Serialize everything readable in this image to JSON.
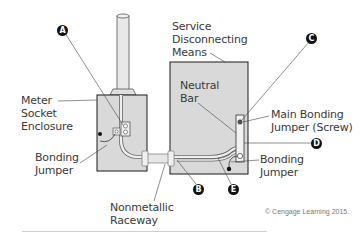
{
  "diagram": {
    "labels": {
      "service_disconnect": [
        "Service",
        "Disconnecting",
        "Means"
      ],
      "neutral_bar": [
        "Neutral",
        "Bar"
      ],
      "meter_socket": [
        "Meter",
        "Socket",
        "Enclosure"
      ],
      "bonding_jumper_left": [
        "Bonding",
        "Jumper"
      ],
      "main_bonding_jumper": [
        "Main Bonding",
        "Jumper (Screw)"
      ],
      "bonding_jumper_right": [
        "Bonding",
        "Jumper"
      ],
      "raceway": [
        "Nonmetallic",
        "Raceway"
      ]
    },
    "callouts": [
      "A",
      "B",
      "C",
      "D",
      "E"
    ],
    "copyright": "© Cengage Learning 2015.",
    "colors": {
      "enclosure_fill": "#d9d9d9",
      "outline": "#1a1a1a",
      "callout_fill": "#111111"
    }
  }
}
